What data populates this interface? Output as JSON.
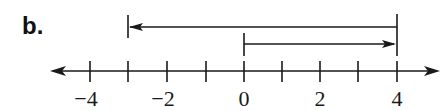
{
  "problem": {
    "label": "b."
  },
  "number_line": {
    "min": -4,
    "max": 4,
    "tick_step": 1,
    "ticks": [
      -4,
      -3,
      -2,
      -1,
      0,
      1,
      2,
      3,
      4
    ],
    "tick_x": [
      90,
      128,
      167,
      206,
      244,
      282,
      320,
      358,
      397
    ],
    "axis_y": 71,
    "labels": [
      {
        "value": -4,
        "text": "−4",
        "x": 90
      },
      {
        "value": -2,
        "text": "−2",
        "x": 167
      },
      {
        "value": 0,
        "text": "0",
        "x": 244
      },
      {
        "value": 2,
        "text": "2",
        "x": 320
      },
      {
        "value": 4,
        "text": "4",
        "x": 397
      }
    ],
    "arrows_both_ends": true
  },
  "vectors": [
    {
      "name": "upper-vector",
      "from": 4,
      "to": -3,
      "direction": "left",
      "y": 27
    },
    {
      "name": "lower-vector",
      "from": 0,
      "to": 4,
      "direction": "right",
      "y": 44
    }
  ],
  "colors": {
    "ink": "#1a1a1a",
    "background": "#ffffff"
  }
}
